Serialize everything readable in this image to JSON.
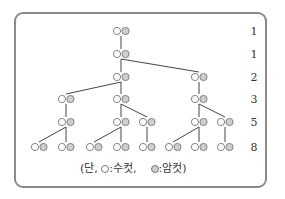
{
  "diagram": {
    "type": "rabbit-pair-family-tree",
    "generation_counts": [
      "1",
      "1",
      "2",
      "3",
      "5",
      "8"
    ],
    "rows_y": [
      31,
      54,
      77,
      99,
      122,
      147
    ],
    "pairs": [
      {
        "id": "a",
        "x": 121,
        "row": 0
      },
      {
        "id": "b",
        "x": 121,
        "row": 1
      },
      {
        "id": "c",
        "x": 121,
        "row": 2
      },
      {
        "id": "d",
        "x": 199,
        "row": 2
      },
      {
        "id": "e",
        "x": 66,
        "row": 3
      },
      {
        "id": "f",
        "x": 121,
        "row": 3
      },
      {
        "id": "g",
        "x": 199,
        "row": 3
      },
      {
        "id": "h",
        "x": 66,
        "row": 4
      },
      {
        "id": "i",
        "x": 121,
        "row": 4
      },
      {
        "id": "j",
        "x": 147,
        "row": 4
      },
      {
        "id": "k",
        "x": 199,
        "row": 4
      },
      {
        "id": "l",
        "x": 225,
        "row": 4
      },
      {
        "id": "m",
        "x": 39,
        "row": 5
      },
      {
        "id": "n",
        "x": 66,
        "row": 5
      },
      {
        "id": "o",
        "x": 94,
        "row": 5
      },
      {
        "id": "p",
        "x": 121,
        "row": 5
      },
      {
        "id": "q",
        "x": 147,
        "row": 5
      },
      {
        "id": "r",
        "x": 173,
        "row": 5
      },
      {
        "id": "s",
        "x": 199,
        "row": 5
      },
      {
        "id": "t",
        "x": 225,
        "row": 5
      }
    ],
    "edges": [
      [
        "a",
        "b"
      ],
      [
        "b",
        "c"
      ],
      [
        "b",
        "d"
      ],
      [
        "c",
        "e"
      ],
      [
        "c",
        "f"
      ],
      [
        "d",
        "g"
      ],
      [
        "e",
        "h"
      ],
      [
        "f",
        "i"
      ],
      [
        "f",
        "j"
      ],
      [
        "g",
        "k"
      ],
      [
        "g",
        "l"
      ],
      [
        "h",
        "m"
      ],
      [
        "h",
        "n"
      ],
      [
        "i",
        "o"
      ],
      [
        "i",
        "p"
      ],
      [
        "j",
        "q"
      ],
      [
        "k",
        "r"
      ],
      [
        "k",
        "s"
      ],
      [
        "l",
        "t"
      ]
    ],
    "colors": {
      "male_fill": "#ffffff",
      "female_fill": "#cfcfcf",
      "stroke": "#777777",
      "edge": "#444444",
      "frame": "#8a8a8a"
    }
  },
  "legend": {
    "prefix": "(단,",
    "male_label": ":수컷,",
    "female_label": ":암컷)"
  }
}
